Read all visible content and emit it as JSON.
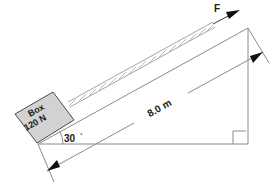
{
  "figure": {
    "background_color": "#ffffff"
  },
  "labels": {
    "force": "F",
    "box_name": "Box",
    "box_weight": "120 N",
    "incline_length": "8.0 m",
    "angle_value": "30",
    "angle_unit": "°"
  },
  "colors": {
    "box_fill": "#d2d2d2",
    "box_stroke": "#4a4a4a",
    "line": "#8a8a8a",
    "text": "#1a1a1a",
    "arrow": "#111111"
  },
  "geometry": {
    "triangle": {
      "left_vertex": [
        38,
        144
      ],
      "right_vertex": [
        248,
        144
      ],
      "apex": [
        248,
        28
      ],
      "angle_deg": 30
    },
    "dimension": {
      "label": "8.0 m",
      "from": [
        47,
        171
      ],
      "to": [
        264,
        52
      ]
    },
    "right_angle_marker": [
      234,
      130
    ]
  },
  "icons": {
    "force_arrow": "arrow-up-right",
    "dimension_arrow_left": "arrow-down-left",
    "dimension_arrow_right": "arrow-up-right",
    "right_angle": "right-angle-square"
  }
}
